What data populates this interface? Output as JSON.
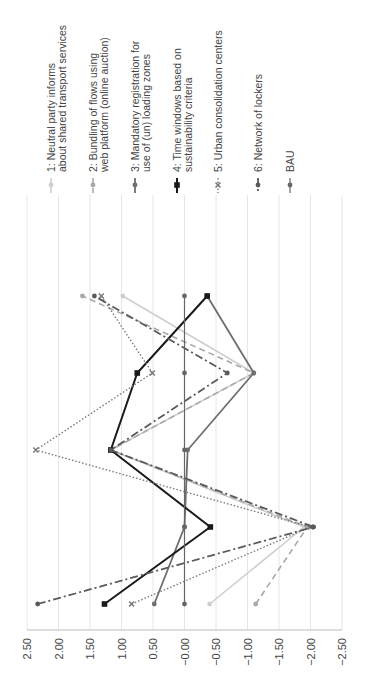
{
  "chart_data": {
    "type": "line",
    "orientation": "rotated-90-ccw",
    "title": "",
    "xlabel": "",
    "ylabel": "",
    "categories": [
      "1",
      "2",
      "3",
      "4",
      "5"
    ],
    "ylim": [
      -2.5,
      2.5
    ],
    "yticks": [
      "2.50",
      "2.00",
      "1.50",
      "1.00",
      "0.50",
      "-0.00",
      "-0.50",
      "-1.00",
      "-1.50",
      "-2.00",
      "-2.50"
    ],
    "grid": true,
    "legend_position": "top (rotated: right)",
    "series": [
      {
        "name": "1: Neutral party informs about shared transport services",
        "label_lines": [
          "1: Neutral party informs",
          "about shared transport services"
        ],
        "color": "#cfcfcf",
        "dash": "",
        "width": 1.6,
        "marker": "circle",
        "values": [
          -0.4,
          -1.9,
          1.17,
          -1.1,
          0.98
        ]
      },
      {
        "name": "2: Bundling of flows using web platform (online auction)",
        "label_lines": [
          "2: Bundling of flows using",
          "web platform (online auction)"
        ],
        "color": "#a8a8a8",
        "dash": "6,4",
        "width": 1.6,
        "marker": "circle",
        "values": [
          -1.13,
          -1.95,
          1.17,
          -1.1,
          1.62
        ]
      },
      {
        "name": "3: Mandatory registration for use of (un) loading zones",
        "label_lines": [
          "3: Mandatory registration for",
          "use of (un) loading zones"
        ],
        "color": "#6e6e6e",
        "dash": "",
        "width": 1.8,
        "marker": "circle",
        "values": [
          0.48,
          0.0,
          -0.05,
          -1.1,
          -0.36
        ]
      },
      {
        "name": "4: Time windows based on sustainability criteria",
        "label_lines": [
          "4: Time windows based on",
          "sustainability criteria"
        ],
        "color": "#1a1a1a",
        "dash": "",
        "width": 2.0,
        "marker": "square",
        "values": [
          1.27,
          -0.41,
          1.17,
          0.75,
          -0.36
        ]
      },
      {
        "name": "5: Urban consolidation centers",
        "label_lines": [
          "5: Urban consolidation centers"
        ],
        "color": "#7a7a7a",
        "dash": "1.5,2",
        "width": 1.4,
        "marker": "x",
        "values": [
          0.84,
          -2.0,
          2.36,
          0.51,
          1.32
        ]
      },
      {
        "name": "6: Network of lockers",
        "label_lines": [
          "6: Network of lockers"
        ],
        "color": "#5a5a5a",
        "dash": "8,3,2,3",
        "width": 1.8,
        "marker": "circle",
        "values": [
          2.33,
          -2.05,
          1.17,
          -0.68,
          1.43
        ]
      },
      {
        "name": "BAU",
        "label_lines": [
          "BAU"
        ],
        "color": "#666666",
        "dash": "",
        "width": 1.2,
        "marker": "circle",
        "values": [
          0,
          0,
          0,
          0,
          0
        ]
      }
    ]
  },
  "caption": {
    "text": ""
  }
}
